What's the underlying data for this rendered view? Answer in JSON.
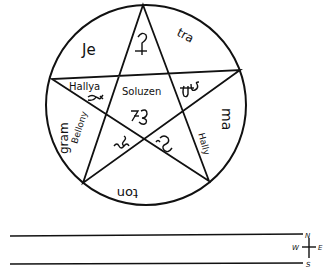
{
  "diagram": {
    "type": "pentagram-in-circle",
    "circle": {
      "cx": 146,
      "cy": 105,
      "r": 100
    },
    "star_vertices": [
      [
        143,
        5
      ],
      [
        240,
        70
      ],
      [
        209,
        181
      ],
      [
        83,
        183
      ],
      [
        52,
        79
      ]
    ],
    "colors": {
      "ink": "#111111",
      "background": "#ffffff"
    },
    "outer_labels": {
      "top_left": "Je",
      "top_right": "tra",
      "right": "ma",
      "bottom": "ton",
      "left": "gram"
    },
    "inner_names": {
      "left_point": "Hallya",
      "center": "Soluzen",
      "lower_left_point": "Bellony",
      "lower_right_point": "Hally"
    },
    "sigils": {
      "top_point": "sigil-top",
      "center": "sigil-center",
      "right_point": "sigil-right",
      "left_point": "sigil-left",
      "lower_left": "sigil-lower-left",
      "lower_right": "sigil-lower-right"
    },
    "compass": {
      "north": "N",
      "south": "S",
      "east": "E",
      "west": "W"
    },
    "lines": [
      {
        "x1": 10,
        "y1": 236,
        "x2": 303,
        "y2": 234
      },
      {
        "x1": 10,
        "y1": 264,
        "x2": 303,
        "y2": 263
      }
    ]
  }
}
